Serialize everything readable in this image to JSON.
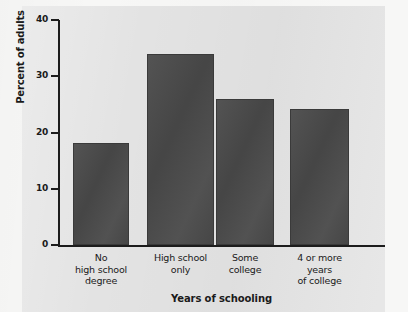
{
  "chart_data": {
    "type": "bar",
    "title": "",
    "xlabel": "Years of schooling",
    "ylabel": "Percent of adults",
    "categories": [
      "No high school degree",
      "High school only",
      "Some college",
      "4 or more years of college"
    ],
    "category_lines": [
      [
        "No",
        "high school",
        "degree"
      ],
      [
        "High school",
        "only"
      ],
      [
        "Some",
        "college"
      ],
      [
        "4 or more",
        "years",
        "of college"
      ]
    ],
    "values": [
      18.2,
      33.9,
      25.9,
      24.2
    ],
    "ylim": [
      0,
      40
    ],
    "yticks": [
      0,
      10,
      20,
      30,
      40
    ],
    "ytick_labels": [
      "0",
      "10",
      "20",
      "30",
      "40"
    ],
    "grid": false,
    "legend": "none",
    "bar_color": "#4a4a4a",
    "panel_color": "#e3e3e3",
    "axis_color": "#1c1c1c"
  },
  "axis": {
    "y_title": "Percent of adults",
    "x_title": "Years of schooling"
  }
}
